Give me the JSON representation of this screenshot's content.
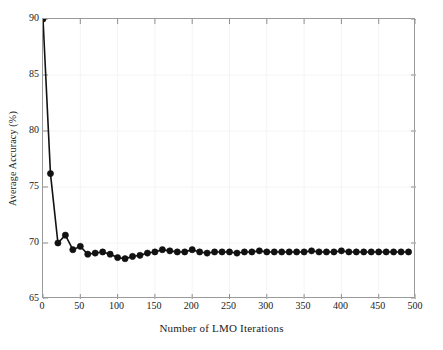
{
  "chart_data": {
    "type": "line",
    "title": "",
    "xlabel": "Number of LMO Iterations",
    "ylabel": "Average Accuracy (%)",
    "xlim": [
      0,
      500
    ],
    "ylim": [
      65,
      90
    ],
    "xticks": [
      0,
      50,
      100,
      150,
      200,
      250,
      300,
      350,
      400,
      450,
      500
    ],
    "yticks": [
      65,
      70,
      75,
      80,
      85,
      90
    ],
    "grid": true,
    "legend": null,
    "marker": "filled-circle",
    "line_color": "#111111",
    "marker_color": "#111111",
    "x": [
      0,
      10,
      20,
      30,
      40,
      50,
      60,
      70,
      80,
      90,
      100,
      110,
      120,
      130,
      140,
      150,
      160,
      170,
      180,
      190,
      200,
      210,
      220,
      230,
      240,
      250,
      260,
      270,
      280,
      290,
      300,
      310,
      320,
      330,
      340,
      350,
      360,
      370,
      380,
      390,
      400,
      410,
      420,
      430,
      440,
      450,
      460,
      470,
      480,
      490
    ],
    "y": [
      90.0,
      76.2,
      70.0,
      70.7,
      69.4,
      69.7,
      69.0,
      69.1,
      69.2,
      69.0,
      68.7,
      68.6,
      68.8,
      68.9,
      69.1,
      69.2,
      69.4,
      69.3,
      69.2,
      69.2,
      69.4,
      69.2,
      69.1,
      69.2,
      69.2,
      69.2,
      69.1,
      69.2,
      69.2,
      69.3,
      69.2,
      69.2,
      69.2,
      69.2,
      69.2,
      69.2,
      69.3,
      69.2,
      69.2,
      69.2,
      69.3,
      69.2,
      69.2,
      69.2,
      69.2,
      69.2,
      69.2,
      69.2,
      69.2,
      69.2
    ]
  }
}
